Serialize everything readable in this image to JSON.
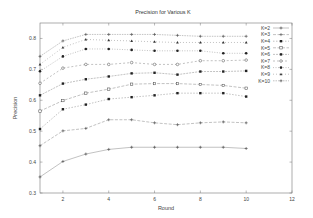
{
  "chart_data": {
    "type": "line",
    "title": "Precision for Various K",
    "xlabel": "Round",
    "ylabel": "Precision",
    "xlim": [
      1,
      12
    ],
    "ylim": [
      0.3,
      0.85
    ],
    "xticks": [
      2,
      4,
      6,
      8,
      10,
      12
    ],
    "yticks": [
      0.3,
      0.4,
      0.5,
      0.6,
      0.7,
      0.8
    ],
    "ytick_labels": [
      "0.3",
      "0.4",
      "0.5",
      "0.6",
      "0.7",
      "0.8"
    ],
    "grid": false,
    "legend_position": "top-right",
    "x": [
      1,
      2,
      3,
      4,
      5,
      6,
      7,
      8,
      9,
      10
    ],
    "series": [
      {
        "name": "K=2",
        "values": [
          0.352,
          0.402,
          0.426,
          0.441,
          0.448,
          0.448,
          0.448,
          0.448,
          0.448,
          0.444
        ]
      },
      {
        "name": "K=3",
        "values": [
          0.453,
          0.501,
          0.509,
          0.537,
          0.537,
          0.527,
          0.521,
          0.527,
          0.53,
          0.527
        ]
      },
      {
        "name": "K=4",
        "values": [
          0.507,
          0.571,
          0.586,
          0.604,
          0.61,
          0.616,
          0.623,
          0.623,
          0.623,
          0.612
        ]
      },
      {
        "name": "K=5",
        "values": [
          0.565,
          0.599,
          0.623,
          0.636,
          0.652,
          0.654,
          0.654,
          0.651,
          0.648,
          0.639
        ]
      },
      {
        "name": "K=6",
        "values": [
          0.616,
          0.654,
          0.668,
          0.677,
          0.687,
          0.689,
          0.683,
          0.693,
          0.693,
          0.695
        ]
      },
      {
        "name": "K=7",
        "values": [
          0.655,
          0.704,
          0.716,
          0.716,
          0.722,
          0.716,
          0.716,
          0.728,
          0.728,
          0.73
        ]
      },
      {
        "name": "K=8",
        "values": [
          0.694,
          0.742,
          0.766,
          0.766,
          0.763,
          0.76,
          0.76,
          0.76,
          0.752,
          0.752
        ]
      },
      {
        "name": "K=9",
        "values": [
          0.716,
          0.771,
          0.797,
          0.794,
          0.792,
          0.789,
          0.787,
          0.787,
          0.787,
          0.787
        ]
      },
      {
        "name": "K=10",
        "values": [
          0.742,
          0.792,
          0.813,
          0.813,
          0.813,
          0.813,
          0.81,
          0.807,
          0.807,
          0.807
        ]
      }
    ]
  }
}
